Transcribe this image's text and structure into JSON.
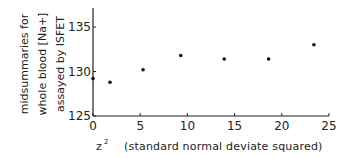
{
  "chart_data": {
    "type": "scatter",
    "title": "",
    "xlabel": "z²   (standard normal deviate squared)",
    "xlabel_main": "z",
    "xlabel_sup": "2",
    "xlabel_desc": "(standard normal deviate squared)",
    "ylabel_lines": [
      "midsummaries for",
      "whole blood [Na+]",
      "assayed by ISFET"
    ],
    "xlim": [
      0,
      25
    ],
    "ylim": [
      125,
      137
    ],
    "xticks": [
      0,
      5,
      10,
      15,
      20,
      25
    ],
    "yticks": [
      125,
      130,
      135
    ],
    "grid": false,
    "legend": null,
    "x": [
      0,
      1.8,
      5.3,
      9.3,
      13.9,
      18.6,
      23.4
    ],
    "y": [
      129.2,
      128.8,
      130.2,
      131.8,
      131.4,
      131.4,
      133.0
    ]
  }
}
